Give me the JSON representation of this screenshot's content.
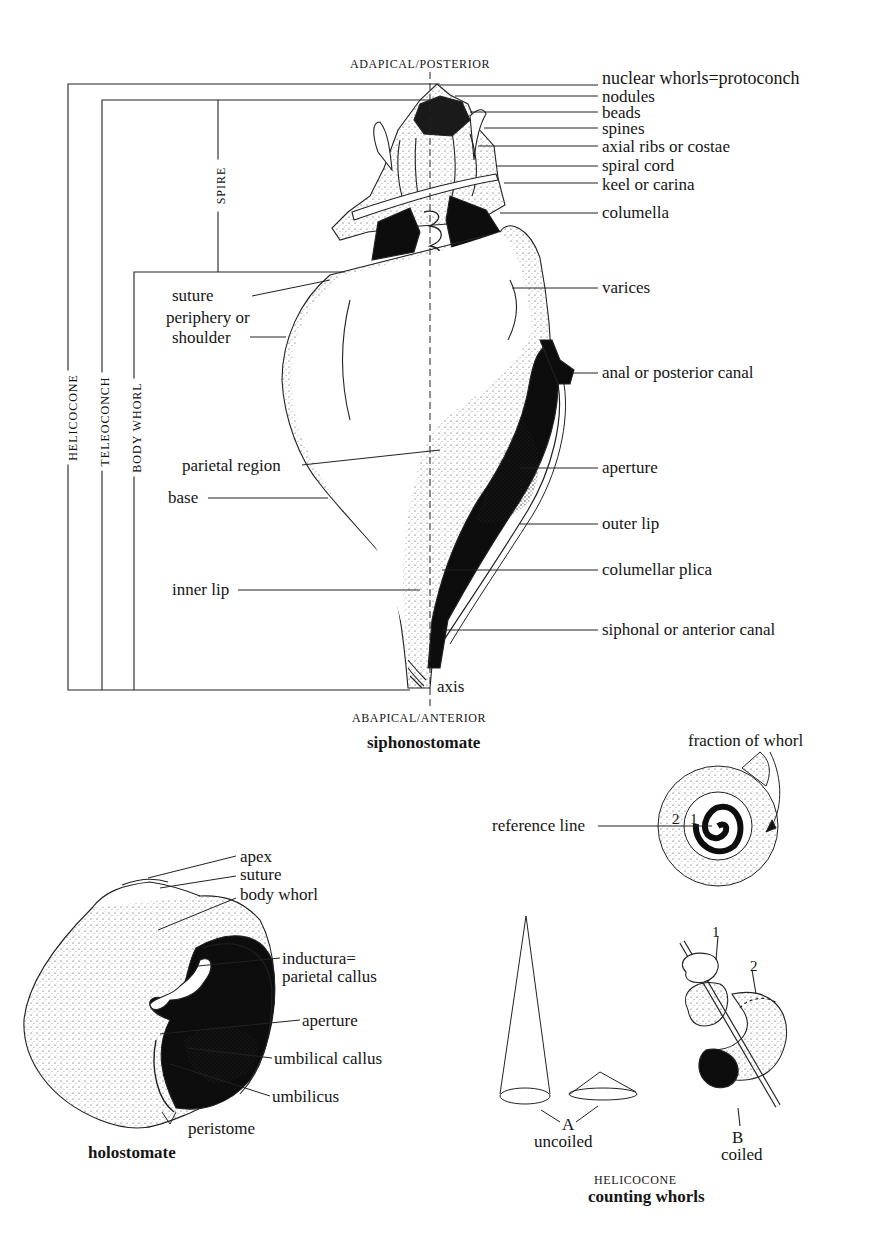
{
  "siphonostomate": {
    "top_label": "ADAPICAL/POSTERIOR",
    "bottom_label": "ABAPICAL/ANTERIOR",
    "caption": "siphonostomate",
    "axis_label": "axis",
    "brackets": {
      "helicocone": "HELICOCONE",
      "teleoconch": "TELEOCONCH",
      "body_whorl": "BODY WHORL",
      "spire": "SPIRE"
    },
    "right_labels": [
      "nuclear whorls=protoconch",
      "nodules",
      "beads",
      "spines",
      "axial ribs or costae",
      "spiral cord",
      "keel or carina",
      "columella",
      "varices",
      "anal or posterior canal",
      "aperture",
      "outer lip",
      "columellar plica",
      "siphonal or anterior canal"
    ],
    "left_labels": [
      "suture",
      "periphery or",
      "shoulder",
      "parietal region",
      "base",
      "inner lip"
    ]
  },
  "holostomate": {
    "caption": "holostomate",
    "labels": [
      "apex",
      "suture",
      "body whorl",
      "inductura=",
      "parietal callus",
      "aperture",
      "umbilical callus",
      "umbilicus",
      "peristome"
    ]
  },
  "counting_whorls": {
    "fraction_label": "fraction of whorl",
    "reference_label": "reference line",
    "spiral_numbers": [
      "2",
      "1"
    ],
    "a_letter": "A",
    "a_label": "uncoiled",
    "b_letter": "B",
    "b_label": "coiled",
    "coil_numbers": [
      "1",
      "2"
    ],
    "subtitle": "HELICOCONE",
    "caption": "counting whorls"
  },
  "colors": {
    "ink": "#111111",
    "paper": "#ffffff"
  }
}
